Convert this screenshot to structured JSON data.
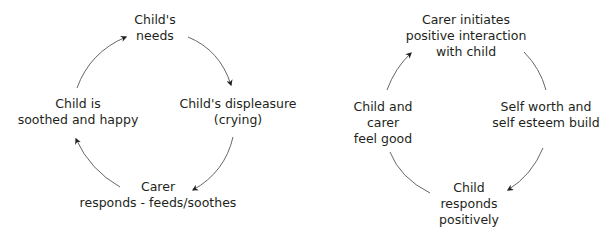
{
  "diagrams": [
    {
      "name": "child-needs-cycle",
      "nodes": [
        {
          "lines": [
            "Child's",
            "needs"
          ]
        },
        {
          "lines": [
            "Child's displeasure",
            "(crying)"
          ]
        },
        {
          "lines": [
            "Carer",
            "responds - feeds/soothes"
          ]
        },
        {
          "lines": [
            "Child is",
            "soothed and happy"
          ]
        }
      ],
      "edges": [
        {
          "from": 0,
          "to": 1,
          "arrow": true
        },
        {
          "from": 1,
          "to": 2,
          "arrow": true
        },
        {
          "from": 2,
          "to": 3,
          "arrow": true
        },
        {
          "from": 3,
          "to": 0,
          "arrow": true
        }
      ]
    },
    {
      "name": "positive-interaction-cycle",
      "nodes": [
        {
          "lines": [
            "Carer initiates",
            "positive interaction",
            "with child"
          ]
        },
        {
          "lines": [
            "Self worth and",
            "self esteem build"
          ]
        },
        {
          "lines": [
            "Child",
            "responds",
            "positively"
          ]
        },
        {
          "lines": [
            "Child and",
            "carer",
            "feel good"
          ]
        }
      ],
      "edges": [
        {
          "from": 0,
          "to": 1,
          "arrow": false
        },
        {
          "from": 1,
          "to": 2,
          "arrow": true
        },
        {
          "from": 2,
          "to": 3,
          "arrow": false
        },
        {
          "from": 3,
          "to": 0,
          "arrow": true
        }
      ]
    }
  ]
}
